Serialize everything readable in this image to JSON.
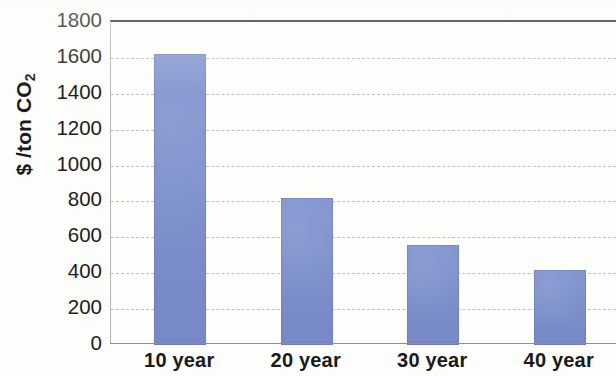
{
  "chart_data": {
    "type": "bar",
    "title": "",
    "xlabel": "",
    "ylabel": "$ /ton CO2",
    "ylabel_display": "$ /ton CO",
    "ylabel_subscript": "2",
    "categories": [
      "10 year",
      "20 year",
      "30 year",
      "40 year"
    ],
    "values": [
      1620,
      820,
      555,
      420
    ],
    "ylim": [
      0,
      1800
    ],
    "ytick_step": 200,
    "ytick_labels": [
      "1800",
      "1600",
      "1400",
      "1200",
      "1000",
      "800",
      "600",
      "400",
      "200",
      "0"
    ],
    "ytick_values": [
      1800,
      1600,
      1400,
      1200,
      1000,
      800,
      600,
      400,
      200,
      0
    ],
    "grid": true,
    "grid_style": "dashed",
    "legend": false,
    "legend_position": "none",
    "series": [
      {
        "name": "cost",
        "values": [
          1620,
          820,
          555,
          420
        ]
      }
    ],
    "colors": {
      "bar_fill": "#7a8ecd",
      "bar_edge": "#5c6ea5",
      "gridline": "#b9c3c9",
      "top_border": "#2b2b2b",
      "axis_line": "#8e8e8e",
      "text": "#1a1a1a",
      "background": "#fdfdfc"
    }
  }
}
